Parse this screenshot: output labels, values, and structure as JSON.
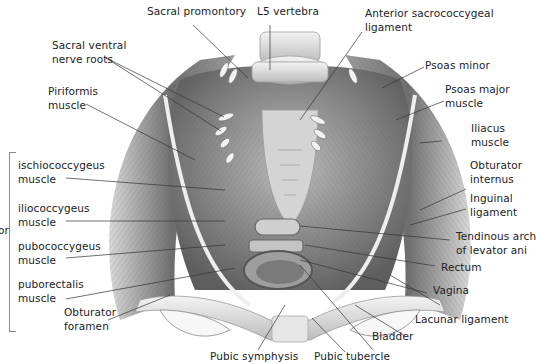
{
  "figure": {
    "group_label_partial": "or",
    "labels": {
      "sacral_promontory": [
        "Sacral promontory"
      ],
      "l5_vertebra": [
        "L5 vertebra"
      ],
      "anterior_sacrococcygeal_ligament": [
        "Anterior sacrococcygeal",
        "ligament"
      ],
      "sacral_ventral_nerve_roots": [
        "Sacral ventral",
        "nerve roots"
      ],
      "piriformis_muscle": [
        "Piriformis",
        "muscle"
      ],
      "psoas_minor": [
        "Psoas minor"
      ],
      "psoas_major_muscle": [
        "Psoas major",
        "muscle"
      ],
      "iliacus_muscle": [
        "Iliacus",
        "muscle"
      ],
      "obturator_internus": [
        "Obturator",
        "internus"
      ],
      "inguinal_ligament": [
        "Inguinal",
        "ligament"
      ],
      "tendinous_arch": [
        "Tendinous arch",
        "of levator ani"
      ],
      "rectum": [
        "Rectum"
      ],
      "vagina": [
        "Vagina"
      ],
      "lacunar_ligament": [
        "Lacunar ligament"
      ],
      "bladder": [
        "Bladder"
      ],
      "pubic_tubercle": [
        "Pubic tubercle"
      ],
      "pubic_symphysis": [
        "Pubic symphysis"
      ],
      "obturator_foramen": [
        "Obturator",
        "foramen"
      ],
      "ischiococcygeus_muscle": [
        "ischiococcygeus",
        "muscle"
      ],
      "iliococcygeus_muscle": [
        "iliococcygeus",
        "muscle"
      ],
      "pubococcygeus_muscle": [
        "pubococcygeus",
        "muscle"
      ],
      "puborectalis_muscle": [
        "puborectalis",
        "muscle"
      ]
    },
    "colors": {
      "background": "#ffffff",
      "text": "#222222",
      "leader_line": "#333333",
      "muscle_dark": "#5a5a5a",
      "muscle_mid": "#9a9a9a",
      "bone": "#e8e8e8"
    }
  }
}
